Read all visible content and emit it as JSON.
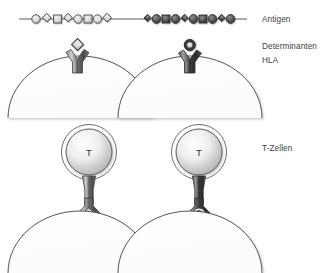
{
  "figure": {
    "language": "de",
    "width": 323,
    "height": 273,
    "background": "#ffffff"
  },
  "labels": [
    {
      "id": "antigen",
      "text": "Antigen"
    },
    {
      "id": "determinanten",
      "text": "Determinanten"
    },
    {
      "id": "hla",
      "text": "HLA"
    },
    {
      "id": "tzellen",
      "text": "T-Zellen"
    }
  ],
  "colors": {
    "line": "#5a5a5a",
    "outline": "#4a4a4a",
    "light_fill": "#d8d8d8",
    "mid_fill": "#a8a8a8",
    "dark_fill": "#4e4e4e",
    "darker_fill": "#2f2f2f",
    "stem": "#6b6b6b",
    "stem_dark": "#4a4a4a",
    "cell_outline": "#555555",
    "text": "#3d3d3d"
  },
  "antigen_chains": [
    {
      "id": "antigen-chain-left",
      "variant": "light",
      "shapes": [
        "circle",
        "diamond",
        "square",
        "diamond",
        "circle",
        "square",
        "circle",
        "diamond"
      ]
    },
    {
      "id": "antigen-chain-right",
      "variant": "dark",
      "shapes": [
        "diamond",
        "circle",
        "square",
        "circle",
        "diamond",
        "circle",
        "square",
        "circle",
        "diamond",
        "circle"
      ]
    }
  ],
  "columns": [
    {
      "id": "column-left",
      "determinant_shape": "diamond",
      "hla_receptor": "y-shaped",
      "tcell_label": "T",
      "binding_complex_shape": "diamond"
    },
    {
      "id": "column-right",
      "determinant_shape": "circle",
      "hla_receptor": "y-shaped",
      "tcell_label": "T",
      "binding_complex_shape": "circle"
    }
  ]
}
